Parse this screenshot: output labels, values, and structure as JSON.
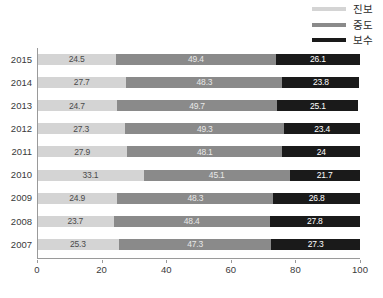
{
  "legend": {
    "position": "top-right",
    "entries": [
      {
        "label": "진보",
        "color": "#d4d4d4",
        "name": "progressive"
      },
      {
        "label": "중도",
        "color": "#8a8a8a",
        "name": "moderate"
      },
      {
        "label": "보수",
        "color": "#1a1a1a",
        "name": "conservative"
      }
    ]
  },
  "axis": {
    "x_ticks": [
      "0",
      "20",
      "40",
      "60",
      "80",
      "100"
    ],
    "x_tick_values": [
      0,
      20,
      40,
      60,
      80,
      100
    ],
    "xmin": 0,
    "xmax": 100
  },
  "chart_data": {
    "type": "bar",
    "orientation": "horizontal",
    "stacked": true,
    "title": "",
    "subtitle": "",
    "xlabel": "",
    "ylabel": "",
    "xlim": [
      0,
      100
    ],
    "grid": false,
    "legend_position": "top-right",
    "categories": [
      "2015",
      "2014",
      "2013",
      "2012",
      "2011",
      "2010",
      "2009",
      "2008",
      "2007"
    ],
    "series": [
      {
        "name": "진보",
        "color": "#d4d4d4",
        "values": [
          24.5,
          27.7,
          24.7,
          27.3,
          27.9,
          33.1,
          24.9,
          23.7,
          25.3
        ]
      },
      {
        "name": "중도",
        "color": "#8a8a8a",
        "values": [
          49.4,
          48.3,
          49.7,
          49.3,
          48.1,
          45.1,
          48.3,
          48.4,
          47.3
        ]
      },
      {
        "name": "보수",
        "color": "#1a1a1a",
        "values": [
          26.1,
          23.8,
          25.1,
          23.4,
          24.0,
          21.7,
          26.8,
          27.8,
          27.3
        ]
      }
    ],
    "data_labels": [
      {
        "category": "2015",
        "values": [
          "24.5",
          "49.4",
          "26.1"
        ]
      },
      {
        "category": "2014",
        "values": [
          "27.7",
          "48.3",
          "23.8"
        ]
      },
      {
        "category": "2013",
        "values": [
          "24.7",
          "49.7",
          "25.1"
        ]
      },
      {
        "category": "2012",
        "values": [
          "27.3",
          "49.3",
          "23.4"
        ]
      },
      {
        "category": "2011",
        "values": [
          "27.9",
          "48.1",
          "24"
        ]
      },
      {
        "category": "2010",
        "values": [
          "33.1",
          "45.1",
          "21.7"
        ]
      },
      {
        "category": "2009",
        "values": [
          "24.9",
          "48.3",
          "26.8"
        ]
      },
      {
        "category": "2008",
        "values": [
          "23.7",
          "48.4",
          "27.8"
        ]
      },
      {
        "category": "2007",
        "values": [
          "25.3",
          "47.3",
          "27.3"
        ]
      }
    ]
  }
}
